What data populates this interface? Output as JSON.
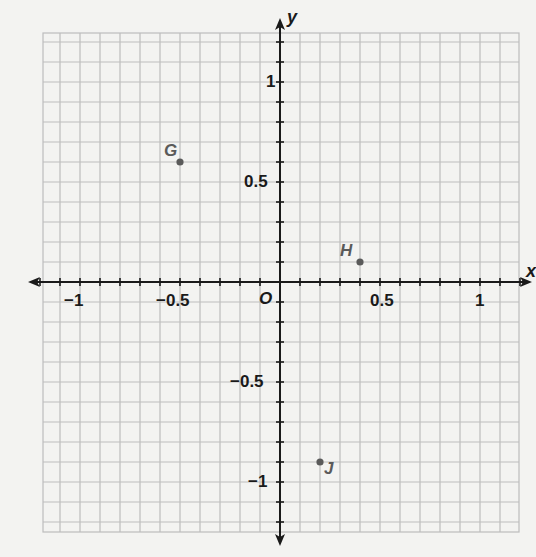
{
  "chart_data": {
    "type": "scatter",
    "title": "",
    "xlabel": "x",
    "ylabel": "y",
    "origin_label": "O",
    "xlim": [
      -1.2,
      1.2
    ],
    "ylim": [
      -1.25,
      1.25
    ],
    "grid": true,
    "grid_step": 0.1,
    "x_ticks": [
      {
        "value": -1,
        "label": "−1"
      },
      {
        "value": -0.5,
        "label": "−0.5"
      },
      {
        "value": 0.5,
        "label": "0.5"
      },
      {
        "value": 1,
        "label": "1"
      }
    ],
    "y_ticks": [
      {
        "value": 1,
        "label": "1"
      },
      {
        "value": 0.5,
        "label": "0.5"
      },
      {
        "value": -0.5,
        "label": "−0.5"
      },
      {
        "value": -1,
        "label": "−1"
      }
    ],
    "points": [
      {
        "name": "G",
        "x": -0.5,
        "y": 0.6
      },
      {
        "name": "H",
        "x": 0.4,
        "y": 0.1
      },
      {
        "name": "J",
        "x": 0.2,
        "y": -0.9
      }
    ]
  },
  "colors": {
    "background": "#f3f3f1",
    "grid": "#bdbdbd",
    "axis": "#1a1a1a",
    "point": "#5a5a5a",
    "label": "#1a1a1a"
  }
}
